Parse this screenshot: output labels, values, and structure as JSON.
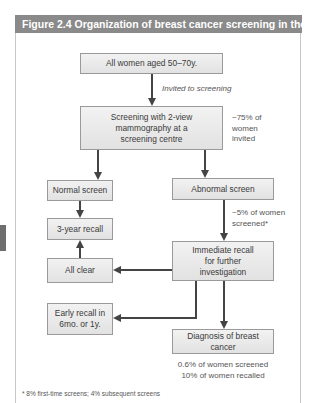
{
  "figure": {
    "title": "Figure 2.4  Organization of breast cancer screening in the UK",
    "colors": {
      "header_bg": "#8a8a8a",
      "box_border": "#9a9a9a",
      "arrow": "#444444"
    }
  },
  "nodes": {
    "all_women": "All women aged 50–70y.",
    "screening_line1": "Screening with 2-view",
    "screening_line2": "mammography at a",
    "screening_line3": "screening centre",
    "normal_screen": "Normal screen",
    "abnormal_screen": "Abnormal screen",
    "three_year_recall": "3-year recall",
    "immediate_line1": "Immediate recall",
    "immediate_line2": "for further",
    "immediate_line3": "investigation",
    "all_clear": "All clear",
    "early_line1": "Early recall in",
    "early_line2": "6mo. or 1y.",
    "diagnosis": "Diagnosis of breast cancer"
  },
  "annotations": {
    "invited": "Invited to screening",
    "pct75_line1": "~75% of",
    "pct75_line2": "women",
    "pct75_line3": "invited",
    "pct5_line1": "~5% of women",
    "pct5_line2": "screened*",
    "diag_line1": "0.6% of women screened",
    "diag_line2": "10% of women recalled"
  },
  "footnote": "* 8% first-time screens; 4% subsequent screens"
}
